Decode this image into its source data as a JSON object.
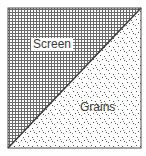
{
  "diagram": {
    "regions": [
      {
        "name": "screen",
        "label": "Screen",
        "pattern": "grid",
        "position": "upper-left triangle"
      },
      {
        "name": "grains",
        "label": "Grains",
        "pattern": "dots",
        "position": "lower-right triangle"
      }
    ],
    "colors": {
      "line": "#3a3a3a",
      "grid": "#6a6a6a",
      "dots": "#555555",
      "background": "#ffffff"
    }
  },
  "labels": {
    "screen": "Screen",
    "grains": "Grains"
  }
}
